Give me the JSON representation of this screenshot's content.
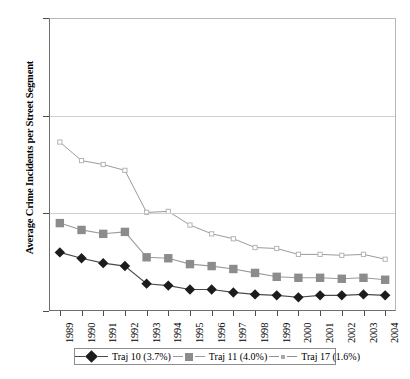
{
  "chart_data": {
    "type": "line",
    "title": "",
    "xlabel": "",
    "ylabel": "Average Crime Incidents per Street Segment",
    "categories": [
      "1989",
      "1990",
      "1991",
      "1992",
      "1993",
      "1994",
      "1995",
      "1996",
      "1997",
      "1998",
      "1999",
      "2000",
      "2001",
      "2002",
      "2003",
      "2004"
    ],
    "ylim": [
      0,
      30
    ],
    "yticks": [
      0,
      10,
      20,
      30
    ],
    "ytick_labels": [
      "0",
      "10",
      "20",
      "30"
    ],
    "grid": "horizontal",
    "legend_position": "bottom",
    "series": [
      {
        "name": "Traj 10 (3.7%)",
        "marker": "filled-diamond",
        "color": "#1c1c1c",
        "line_color": "#4a4a4a",
        "values": [
          6.0,
          5.4,
          4.9,
          4.6,
          2.8,
          2.6,
          2.2,
          2.2,
          1.9,
          1.7,
          1.6,
          1.4,
          1.6,
          1.6,
          1.7,
          1.6
        ]
      },
      {
        "name": "Traj 11 (4.0%)",
        "marker": "filled-square",
        "color": "#8c8c8c",
        "line_color": "#9a9a9a",
        "values": [
          9.0,
          8.3,
          7.9,
          8.1,
          5.5,
          5.4,
          4.8,
          4.6,
          4.3,
          3.9,
          3.5,
          3.4,
          3.4,
          3.3,
          3.4,
          3.2
        ]
      },
      {
        "name": "Traj 17 (1.6%)",
        "marker": "open-square",
        "color": "#b5b5b5",
        "line_color": "#8f8f8f",
        "values": [
          17.3,
          15.4,
          15.0,
          14.4,
          10.1,
          10.2,
          8.8,
          7.9,
          7.4,
          6.5,
          6.4,
          5.8,
          5.8,
          5.7,
          5.8,
          5.3
        ]
      }
    ]
  },
  "axis": {
    "y_title": "Average Crime Incidents per Street Segment"
  },
  "legend": {
    "items": [
      {
        "label": "Traj 10 (3.7%)",
        "marker": "filled-diamond"
      },
      {
        "label": "Traj 11 (4.0%)",
        "marker": "filled-square"
      },
      {
        "label": "Traj 17 (1.6%)",
        "marker": "open-square"
      }
    ]
  },
  "caption": {
    "text": ""
  }
}
